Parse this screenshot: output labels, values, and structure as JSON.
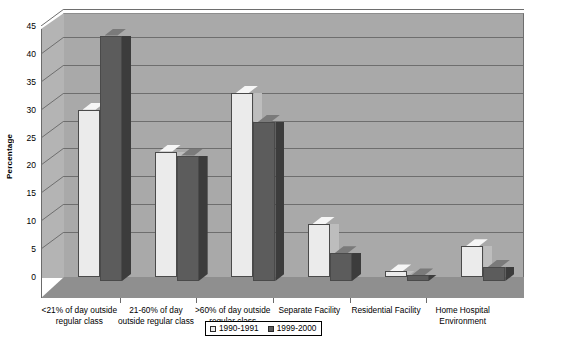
{
  "chart_data": {
    "type": "bar",
    "title": "",
    "xlabel": "",
    "ylabel": "Percentage",
    "ylim": [
      0,
      45
    ],
    "ytick_step": 5,
    "grid": true,
    "legend_position": "bottom",
    "style": "3d-clustered-column",
    "categories": [
      "<21% of day outside\nregular class",
      "21-60% of day\noutside regular class",
      ">60% of day outside\nregular class",
      "Separate Facility",
      "Residential Facility",
      "Home Hospital\nEnvironment"
    ],
    "yticks": [
      "0",
      "5",
      "10",
      "15",
      "20",
      "25",
      "30",
      "35",
      "40",
      "45"
    ],
    "series": [
      {
        "name": "1990-1991",
        "color": "#ebebeb",
        "values": [
          30,
          22.5,
          33,
          9.5,
          1,
          5.5
        ]
      },
      {
        "name": "1999-2000",
        "color": "#5c5c5c",
        "values": [
          44,
          22.5,
          28.5,
          5,
          1,
          2.5
        ]
      }
    ]
  },
  "legend": {
    "items": [
      {
        "label": "1990-1991"
      },
      {
        "label": "1999-2000"
      }
    ]
  },
  "colors": {
    "series_1990": "#ebebeb",
    "series_1999": "#5c5c5c",
    "backwall": "#a9a9a9",
    "sidewall": "#b4b4b4",
    "floor": "#8f8f8f",
    "gridline": "#6e6e6e",
    "background": "#ffffff"
  }
}
